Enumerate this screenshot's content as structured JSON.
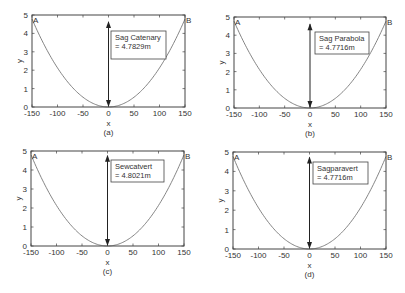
{
  "figure": {
    "background": "#ffffff",
    "axis_color": "#444444",
    "curve_color": "#777777",
    "arrow_color": "#222222"
  },
  "chart_data": [
    {
      "type": "line",
      "panel_label": "(a)",
      "title": "",
      "xlabel": "x",
      "ylabel": "y",
      "xlim": [
        -150,
        150
      ],
      "ylim": [
        0,
        5
      ],
      "xticks": [
        "-150",
        "-100",
        "-50",
        "0",
        "50",
        "100",
        "150"
      ],
      "yticks": [
        "0",
        "1",
        "2",
        "3",
        "4",
        "5"
      ],
      "grid": false,
      "point_labels": [
        "A",
        "B"
      ],
      "annotation": {
        "line1": "Sag Catenary",
        "line2": "= 4.7829m"
      },
      "sag": 4.7829,
      "curve": "catenary",
      "series": [
        {
          "name": "conductor",
          "x": [
            -150,
            -100,
            -50,
            0,
            50,
            100,
            150
          ],
          "y": [
            4.78,
            2.12,
            0.53,
            0,
            0.53,
            2.12,
            4.78
          ]
        }
      ],
      "layout": {
        "left": 32,
        "top": 15,
        "width": 153,
        "height": 92,
        "box": [
          111,
          31,
          55,
          28
        ]
      }
    },
    {
      "type": "line",
      "panel_label": "(b)",
      "title": "",
      "xlabel": "x",
      "ylabel": "y",
      "xlim": [
        -150,
        150
      ],
      "ylim": [
        0,
        5
      ],
      "xticks": [
        "-150",
        "-100",
        "-50",
        "0",
        "50",
        "100",
        "150"
      ],
      "yticks": [
        "0",
        "1",
        "2",
        "3",
        "4",
        "5"
      ],
      "grid": false,
      "point_labels": [
        "A",
        "B"
      ],
      "annotation": {
        "line1": "Sag Parabola",
        "line2": "= 4.7716m"
      },
      "sag": 4.7716,
      "curve": "parabola",
      "series": [
        {
          "name": "conductor",
          "x": [
            -150,
            -100,
            -50,
            0,
            50,
            100,
            150
          ],
          "y": [
            4.77,
            2.12,
            0.53,
            0,
            0.53,
            2.12,
            4.77
          ]
        }
      ],
      "layout": {
        "left": 234,
        "top": 17,
        "width": 152,
        "height": 91,
        "box": [
          315,
          32,
          54,
          22
        ]
      }
    },
    {
      "type": "line",
      "panel_label": "(c)",
      "title": "",
      "xlabel": "x",
      "ylabel": "y",
      "xlim": [
        -150,
        150
      ],
      "ylim": [
        0,
        5
      ],
      "xticks": [
        "-150",
        "-100",
        "-50",
        "0",
        "50",
        "100",
        "150"
      ],
      "yticks": [
        "0",
        "1",
        "2",
        "3",
        "4",
        "5"
      ],
      "grid": false,
      "point_labels": [
        "A",
        "B"
      ],
      "annotation": {
        "line1": "Sewcatvert",
        "line2": "= 4.8021m"
      },
      "sag": 4.8021,
      "curve": "catenary",
      "series": [
        {
          "name": "conductor",
          "x": [
            -150,
            -100,
            -50,
            0,
            50,
            100,
            150
          ],
          "y": [
            4.8,
            2.13,
            0.53,
            0,
            0.53,
            2.13,
            4.8
          ]
        }
      ],
      "layout": {
        "left": 31,
        "top": 151,
        "width": 153,
        "height": 95,
        "box": [
          111,
          160,
          53,
          22
        ]
      }
    },
    {
      "type": "line",
      "panel_label": "(d)",
      "title": "",
      "xlabel": "x",
      "ylabel": "y",
      "xlim": [
        -150,
        150
      ],
      "ylim": [
        0,
        5
      ],
      "xticks": [
        "-150",
        "-100",
        "-50",
        "0",
        "50",
        "100",
        "150"
      ],
      "yticks": [
        "0",
        "1",
        "2",
        "3",
        "4",
        "5"
      ],
      "grid": false,
      "point_labels": [
        "A",
        "B"
      ],
      "annotation": {
        "line1": "Sagparavert",
        "line2": "= 4.7716m"
      },
      "sag": 4.7716,
      "curve": "parabola",
      "series": [
        {
          "name": "conductor",
          "x": [
            -150,
            -100,
            -50,
            0,
            50,
            100,
            150
          ],
          "y": [
            4.77,
            2.12,
            0.53,
            0,
            0.53,
            2.12,
            4.77
          ]
        }
      ],
      "layout": {
        "left": 233,
        "top": 152,
        "width": 153,
        "height": 97,
        "box": [
          313,
          162,
          55,
          22
        ]
      }
    }
  ]
}
